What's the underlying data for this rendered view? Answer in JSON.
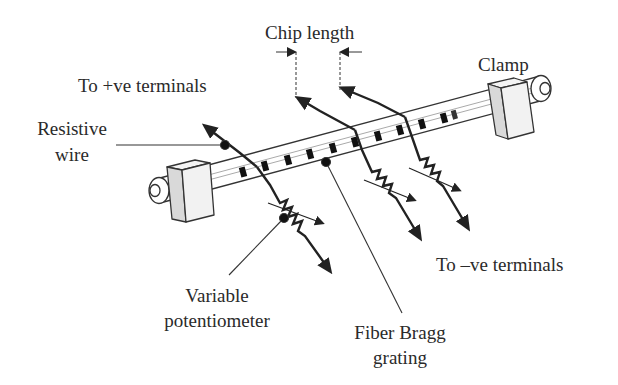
{
  "diagram": {
    "type": "fiber-bragg-grating-heating-setup",
    "labels": {
      "chip_length": "Chip length",
      "clamp": "Clamp",
      "to_positive_terminals": "To +ve terminals",
      "resistive_wire_line1": "Resistive",
      "resistive_wire_line2": "wire",
      "to_negative_terminals": "To –ve terminals",
      "variable_potentiometer_line1": "Variable",
      "variable_potentiometer_line2": "potentiometer",
      "fiber_bragg_grating_line1": "Fiber Bragg",
      "fiber_bragg_grating_line2": "grating"
    },
    "components": [
      {
        "name": "optical-fiber",
        "count": 1
      },
      {
        "name": "clamp",
        "count": 2
      },
      {
        "name": "resistive-wire-heater",
        "count": 3
      },
      {
        "name": "variable-potentiometer",
        "count": 3
      },
      {
        "name": "grating-segment",
        "count": 14
      }
    ],
    "colors": {
      "line": "#222222",
      "text": "#2a2a2a",
      "clamp_face": "#f2f2f2",
      "clamp_side": "#d9d9d9",
      "grating": "#111111"
    }
  }
}
